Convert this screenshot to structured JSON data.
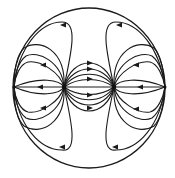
{
  "diagram": {
    "colors": {
      "stroke": "#1a1a1a",
      "background": "#ffffff"
    },
    "boundary": {
      "shape": "circle",
      "cx": 89,
      "cy": 88,
      "rx": 76,
      "ry": 80
    },
    "poles": [
      {
        "name": "left-pole",
        "x": 64,
        "y": 87
      },
      {
        "name": "right-pole",
        "x": 114,
        "y": 87
      }
    ],
    "edge_points": [
      {
        "name": "left-edge-point",
        "x": 14,
        "y": 87
      },
      {
        "name": "right-edge-point",
        "x": 165,
        "y": 87
      }
    ],
    "axis": {
      "y": 87,
      "x_start": 14,
      "x_end": 165
    },
    "central_arrows_direction": "right",
    "outer_arrows_direction": "toward-boundary"
  }
}
